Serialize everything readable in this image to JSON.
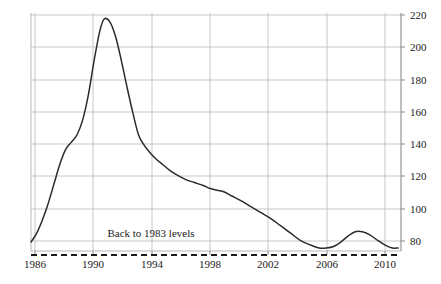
{
  "chart_data": {
    "type": "line",
    "title": "",
    "subtitle": "",
    "xlabel": "",
    "ylabel": "",
    "xlim": [
      1985.4,
      1990.4
    ],
    "xlim_full": [
      1985.4,
      2011.2
    ],
    "ylim": [
      72,
      232
    ],
    "grid": true,
    "legend": null,
    "y_axis_position": "right",
    "x_ticks": [
      "1986",
      "1990",
      "1994",
      "1998",
      "2002",
      "2006",
      "2010"
    ],
    "x_tick_values": [
      1986,
      1990,
      1994,
      1998,
      2002,
      2006,
      2010
    ],
    "y_ticks": [
      "80",
      "100",
      "120",
      "140",
      "160",
      "180",
      "200",
      "220"
    ],
    "y_tick_values": [
      80,
      100,
      120,
      140,
      160,
      180,
      200,
      220
    ],
    "series": [
      {
        "name": "index",
        "color": "#2b2b2b",
        "x": [
          1985.4,
          1985.8,
          1986.2,
          1986.6,
          1987.0,
          1987.4,
          1987.8,
          1988.2,
          1988.6,
          1989.0,
          1989.4,
          1989.8,
          1990.2,
          1990.5,
          1990.9,
          1991.3,
          1991.7,
          1992.1,
          1992.5,
          1992.9,
          1993.3,
          1993.7,
          1994.1,
          1994.6,
          1995.1,
          1995.6,
          1996.2,
          1996.8,
          1997.4,
          1997.9,
          1998.3,
          1998.8,
          1999.4,
          2000.0,
          2000.7,
          2001.4,
          2002.1,
          2002.8,
          2003.5,
          2004.2,
          2004.9,
          2005.5,
          2006.0,
          2006.5,
          2007.0,
          2007.5,
          2008.0,
          2008.5,
          2009.0,
          2009.6,
          2010.1,
          2010.6,
          2011.0
        ],
        "y": [
          78,
          84,
          93,
          104,
          117,
          130,
          140,
          145,
          150,
          160,
          177,
          200,
          220,
          228,
          226,
          216,
          200,
          182,
          165,
          150,
          143,
          138,
          134,
          130,
          126,
          123,
          120,
          118,
          116,
          114,
          113,
          112,
          109,
          106,
          102,
          98,
          94,
          89,
          84,
          79,
          76,
          74,
          74,
          75,
          78,
          82,
          85,
          85,
          83,
          79,
          76,
          74,
          74
        ]
      }
    ],
    "reference_line": {
      "name": "back-to-1983-levels",
      "value": 73,
      "style": "dashed",
      "color": "#1a1a1a",
      "label": "Back to 1983 levels",
      "label_x": 1992.5,
      "label_y": 82
    },
    "annotations": [
      {
        "text": "Back to 1983 levels",
        "x": 1992.5,
        "y": 82
      }
    ],
    "colors": {
      "line": "#2b2b2b",
      "grid": "#b9b9b9",
      "axis": "#8d8d8d",
      "reference": "#1a1a1a",
      "background": "#ffffff",
      "text": "#1a1a1a"
    }
  },
  "geometry": {
    "plot_left": 31,
    "plot_right": 401,
    "plot_top": 13,
    "plot_bottom": 251,
    "x_tick_px": [
      35,
      93,
      152,
      210,
      268,
      327,
      385
    ],
    "y_tick_px": [
      241,
      209,
      176,
      144,
      112,
      80,
      47,
      15
    ],
    "baseline_px": 255,
    "annotation_px": {
      "x": 151,
      "y": 233
    }
  }
}
